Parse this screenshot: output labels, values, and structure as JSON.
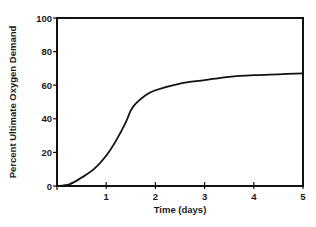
{
  "chart_data": {
    "type": "line",
    "title": "",
    "xlabel": "Time (days)",
    "ylabel": "Percent Ultimate Oxygen Demand",
    "xlim": [
      0,
      5
    ],
    "ylim": [
      0,
      100
    ],
    "x_ticks": [
      1,
      2,
      3,
      4,
      5
    ],
    "y_ticks": [
      0,
      20,
      40,
      60,
      80,
      100
    ],
    "grid": false,
    "legend": null,
    "series": [
      {
        "name": "Oxygen demand",
        "x": [
          0,
          0.25,
          0.5,
          0.75,
          1.0,
          1.2,
          1.4,
          1.5,
          1.6,
          1.8,
          2.0,
          2.5,
          3.0,
          3.5,
          4.0,
          4.5,
          5.0
        ],
        "y": [
          0,
          1,
          5,
          10,
          18,
          27,
          38,
          45,
          49,
          54,
          57,
          61,
          63,
          65,
          66,
          66.5,
          67
        ]
      }
    ]
  },
  "axes": {
    "y_tick_labels": [
      "0",
      "20",
      "40",
      "60",
      "80",
      "100"
    ],
    "x_tick_labels": [
      "1",
      "2",
      "3",
      "4",
      "5"
    ],
    "x_title": "Time (days)",
    "y_title": "Percent Ultimate Oxygen Demand"
  },
  "colors": {
    "line": "#111111",
    "frame": "#111111",
    "background": "#ffffff"
  }
}
